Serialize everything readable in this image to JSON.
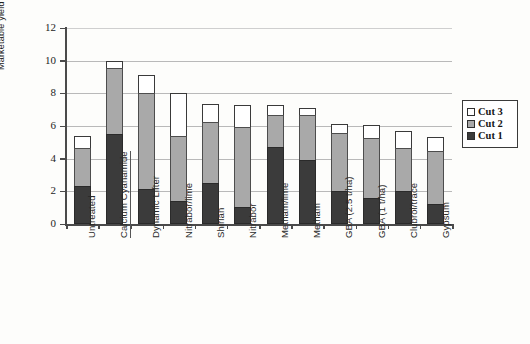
{
  "chart_data": {
    "type": "bar",
    "stacked": true,
    "title": "",
    "xlabel": "",
    "ylabel": "Marketable yield t/ha",
    "ylim": [
      0,
      12
    ],
    "yticks": [
      0,
      2,
      4,
      6,
      8,
      10,
      12
    ],
    "grid": true,
    "legend_position": "right",
    "categories": [
      "Untreated",
      "Calcium Cyanamide",
      "Dynamic Lifter",
      "Nitrabor/lime",
      "Shirlan",
      "Nitrabor",
      "Metham/lime",
      "Metham",
      "GBA (2.5 t/ha)",
      "GBA (1 t/ha)",
      "Clubrol/trace",
      "Gypsum"
    ],
    "series": [
      {
        "name": "Cut 1",
        "color": "#3b3b3b",
        "values": [
          2.3,
          5.5,
          2.15,
          1.4,
          2.5,
          1.05,
          4.7,
          3.9,
          2.0,
          1.6,
          2.0,
          1.2
        ]
      },
      {
        "name": "Cut 2",
        "color": "#a9a9a9",
        "values": [
          2.35,
          4.05,
          5.85,
          4.0,
          3.75,
          4.9,
          2.0,
          2.75,
          3.55,
          3.65,
          2.65,
          3.3
        ]
      },
      {
        "name": "Cut 3",
        "color": "#ffffff",
        "values": [
          0.75,
          0.45,
          1.1,
          2.6,
          1.1,
          1.35,
          0.6,
          0.45,
          0.6,
          0.8,
          1.05,
          0.85
        ]
      }
    ],
    "totals": [
      5.4,
      10.0,
      9.1,
      8.0,
      7.35,
      7.3,
      7.3,
      7.1,
      6.15,
      6.05,
      5.7,
      5.35
    ],
    "underlined_categories": [
      "Calcium Cyanamide"
    ]
  },
  "legend": {
    "items": [
      {
        "label": "Cut 3",
        "swatch": "cut3"
      },
      {
        "label": "Cut 2",
        "swatch": "cut2"
      },
      {
        "label": "Cut 1",
        "swatch": "cut1"
      }
    ]
  }
}
